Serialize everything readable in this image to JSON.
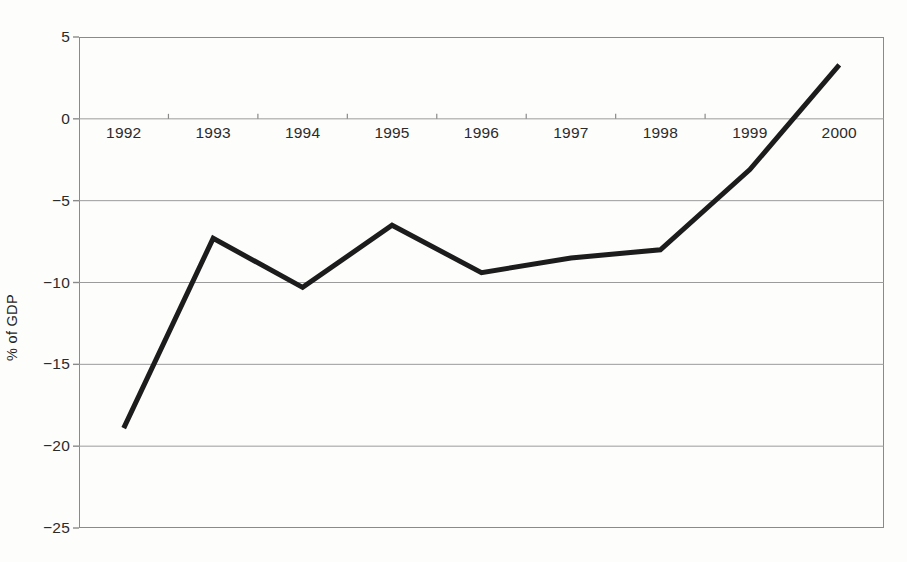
{
  "chart_data": {
    "type": "line",
    "title": "",
    "subtitle": "",
    "xlabel": "",
    "ylabel": "% of GDP",
    "categories": [
      "1992",
      "1993",
      "1994",
      "1995",
      "1996",
      "1997",
      "1998",
      "1999",
      "2000"
    ],
    "x": [
      1992,
      1993,
      1994,
      1995,
      1996,
      1997,
      1998,
      1999,
      2000
    ],
    "values": [
      -18.9,
      -7.3,
      -10.3,
      -6.5,
      -9.4,
      -8.5,
      -8.0,
      -3.1,
      3.3
    ],
    "series": [
      {
        "name": "% of GDP",
        "values": [
          -18.9,
          -7.3,
          -10.3,
          -6.5,
          -9.4,
          -8.5,
          -8.0,
          -3.1,
          3.3
        ]
      }
    ],
    "ylim": [
      -25,
      5
    ],
    "ytick_values": [
      5,
      0,
      -5,
      -10,
      -15,
      -20,
      -25
    ],
    "ytick_labels": [
      "5",
      "0",
      "−5",
      "−10",
      "−15",
      "−20",
      "−25"
    ],
    "xlim": [
      1991.5,
      2000.5
    ],
    "grid": true,
    "grid_axis": "y",
    "legend": false,
    "legend_position": "none",
    "annotations": [],
    "line_color": "#1c1c1c",
    "line_width_px": 5,
    "grid_color": "#9b9b9b",
    "axis_color": "#8a8a8a",
    "background_color": "#fdfdfc",
    "text_color": "#2b2b2b",
    "zero_line_value": 0,
    "xlabels_on_zero_line": true
  }
}
